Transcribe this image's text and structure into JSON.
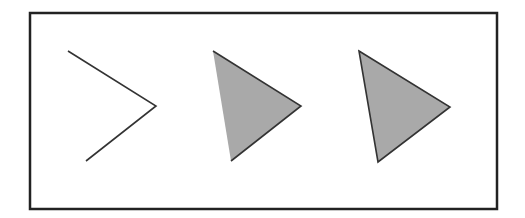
{
  "diagram": {
    "colors": {
      "background": "#ffffff",
      "frame": "#222222",
      "stroke": "#333333",
      "fill": "#a9a9a9"
    },
    "shapes": [
      {
        "id": "open-chevron",
        "type": "polyline",
        "points": "68,51 156,106 86,161"
      },
      {
        "id": "triangle-partial-stroke",
        "type": "polygon",
        "points": "213,51 301,106 231,161",
        "stroke_left_edge": false
      },
      {
        "id": "triangle-full-stroke",
        "type": "polygon",
        "points": "359,51 450,107 378,162",
        "stroke_left_edge": true
      }
    ]
  }
}
